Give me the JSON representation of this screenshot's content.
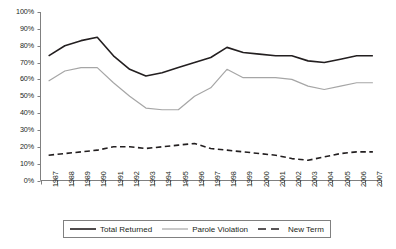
{
  "chart_data": {
    "type": "line",
    "title": "",
    "xlabel": "",
    "ylabel": "",
    "ylim": [
      0,
      100
    ],
    "y_tick_labels": [
      "100%",
      "90%",
      "80%",
      "70%",
      "60%",
      "50%",
      "40%",
      "30%",
      "20%",
      "10%",
      "0%"
    ],
    "y_tick_values": [
      100,
      90,
      80,
      70,
      60,
      50,
      40,
      30,
      20,
      10,
      0
    ],
    "grid": false,
    "legend_position": "bottom",
    "categories": [
      "1987",
      "1988",
      "1989",
      "1990",
      "1991",
      "1992",
      "1993",
      "1994",
      "1995",
      "1996",
      "1997",
      "1998",
      "1999",
      "2000",
      "2001",
      "2002",
      "2003",
      "2004",
      "2005",
      "2006",
      "2007"
    ],
    "series": [
      {
        "name": "Total Returned",
        "style": "solid",
        "color": "#231f20",
        "values": [
          74,
          80,
          83,
          85,
          74,
          66,
          62,
          64,
          67,
          70,
          73,
          79,
          76,
          75,
          74,
          74,
          71,
          70,
          72,
          74,
          74
        ]
      },
      {
        "name": "Parole Violation",
        "style": "solid",
        "color": "#a6a6a6",
        "values": [
          59,
          65,
          67,
          67,
          58,
          50,
          43,
          42,
          42,
          50,
          55,
          66,
          61,
          61,
          61,
          60,
          56,
          54,
          56,
          58,
          58
        ]
      },
      {
        "name": "New Term",
        "style": "dashed",
        "color": "#231f20",
        "values": [
          15,
          16,
          17,
          18,
          20,
          20,
          19,
          20,
          21,
          22,
          19,
          18,
          17,
          16,
          15,
          13,
          12,
          14,
          16,
          17,
          17
        ]
      }
    ]
  },
  "legend": {
    "items": [
      {
        "label": "Total Returned",
        "swatch": "solid-black-line-swatch"
      },
      {
        "label": "Parole Violation",
        "swatch": "solid-gray-line-swatch"
      },
      {
        "label": "New Term",
        "swatch": "dashed-black-line-swatch"
      }
    ]
  }
}
